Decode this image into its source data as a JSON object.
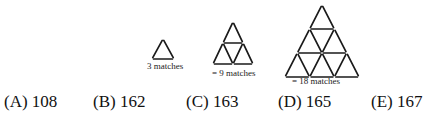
{
  "figures": [
    {
      "rows": 1,
      "caption": "3 matches"
    },
    {
      "rows": 2,
      "caption": "= 9 matches"
    },
    {
      "rows": 3,
      "caption": "= 18 matches"
    }
  ],
  "options": [
    {
      "label": "(A) 108"
    },
    {
      "label": "(B) 162"
    },
    {
      "label": "(C) 163"
    },
    {
      "label": "(D) 165"
    },
    {
      "label": "(E) 167"
    }
  ],
  "colors": {
    "match": "#1a1a1a",
    "background": "#ffffff"
  }
}
